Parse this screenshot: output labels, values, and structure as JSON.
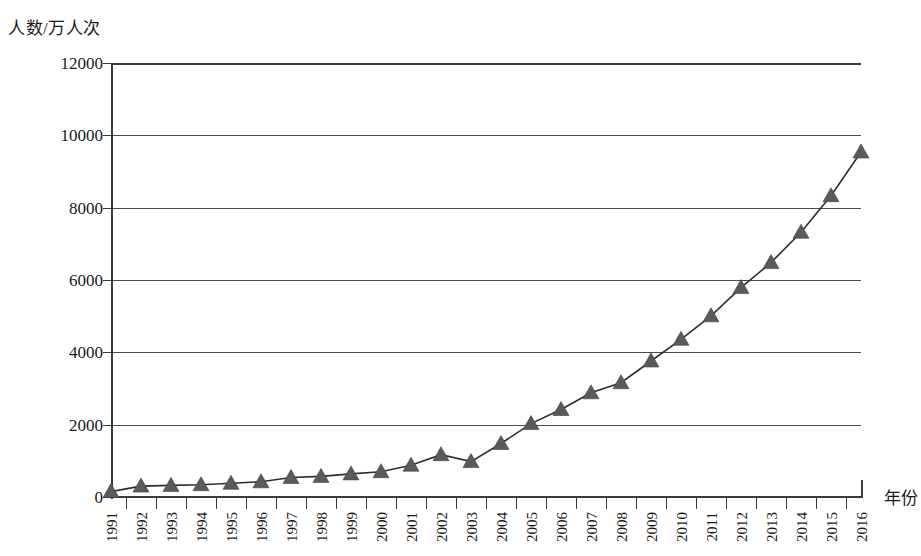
{
  "chart_data": {
    "type": "line",
    "title": "",
    "subtitle": "",
    "ylabel": "人数/万人次",
    "xlabel": "年份",
    "ylim": [
      0,
      12000
    ],
    "yticks": [
      0,
      2000,
      4000,
      6000,
      8000,
      10000,
      12000
    ],
    "grid": true,
    "legend": "none",
    "marker": "triangle",
    "line_color": "#2e2e2e",
    "marker_color": "#5a5a5a",
    "categories": [
      "1991",
      "1992",
      "1993",
      "1994",
      "1995",
      "1996",
      "1997",
      "1998",
      "1999",
      "2000",
      "2001",
      "2002",
      "2003",
      "2004",
      "2005",
      "2006",
      "2007",
      "2008",
      "2009",
      "2010",
      "2011",
      "2012",
      "2013",
      "2014",
      "2015",
      "2016"
    ],
    "x": [
      1991,
      1992,
      1993,
      1994,
      1995,
      1996,
      1997,
      1998,
      1999,
      2000,
      2001,
      2002,
      2003,
      2004,
      2005,
      2006,
      2007,
      2008,
      2009,
      2010,
      2011,
      2012,
      2013,
      2014,
      2015,
      2016
    ],
    "values": [
      150,
      300,
      320,
      340,
      380,
      420,
      540,
      570,
      640,
      700,
      880,
      1170,
      980,
      1480,
      2030,
      2420,
      2880,
      3160,
      3760,
      4360,
      5010,
      5790,
      6480,
      7320,
      8330,
      9540
    ],
    "series": [
      {
        "name": "人数",
        "values": [
          150,
          300,
          320,
          340,
          380,
          420,
          540,
          570,
          640,
          700,
          880,
          1170,
          980,
          1480,
          2030,
          2420,
          2880,
          3160,
          3760,
          4360,
          5010,
          5790,
          6480,
          7320,
          8330,
          9540
        ]
      }
    ],
    "annotations": []
  }
}
